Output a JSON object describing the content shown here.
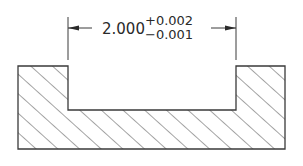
{
  "diagram": {
    "type": "engineering-drawing-section",
    "dimension": {
      "nominal": "2.000",
      "upper_tolerance": "+0.002",
      "lower_tolerance": "−0.001"
    },
    "part": {
      "description": "U-channel cross-section with hatching",
      "hatch": "diagonal"
    },
    "colors": {
      "line": "#3a3a3a",
      "background": "#ffffff"
    }
  }
}
